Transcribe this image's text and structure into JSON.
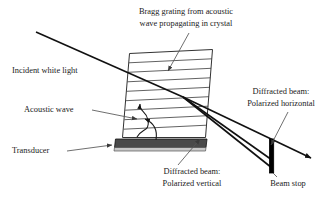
{
  "figure": {
    "background_color": "#ffffff",
    "line_color": "#1a1a1a",
    "leader_color": "#555555",
    "transducer_color": "#4a4a4a",
    "beam_stop_color": "#000000"
  },
  "labels": {
    "bragg_grating_line1": "Bragg grating from acoustic",
    "bragg_grating_line2": "wave propagating in crystal",
    "incident_white_light": "Incident white light",
    "acoustic_wave": "Acoustic wave",
    "transducer": "Transducer",
    "diffracted_horizontal_line1": "Diffracted beam:",
    "diffracted_horizontal_line2": "Polarized horizontal",
    "diffracted_vertical_line1": "Diffracted beam:",
    "diffracted_vertical_line2": "Polarized vertical",
    "beam_stop": "Beam stop"
  },
  "icons": {
    "arrow_bragg": "arrow-down-left-icon",
    "arrow_acoustic": "arrow-right-icon",
    "arrow_transducer": "arrow-right-icon",
    "arrow_diffracted_horizontal": "arrow-down-left-icon",
    "arrow_diffracted_vertical": "arrow-up-right-icon",
    "arrow_beam_tip": "arrow-right-icon",
    "acoustic_wave_curve": "wave-arrow-icon"
  },
  "components": {
    "crystal": {
      "name": "acousto-optic crystal",
      "shape": "parallelogram",
      "grating_line_count": 9
    },
    "transducer": {
      "name": "piezoelectric transducer",
      "shape": "bar"
    },
    "beam_stop": {
      "name": "beam stop",
      "shape": "vertical bar"
    }
  },
  "beams": {
    "incident": "white light entering crystal from upper left",
    "diffracted_count": 2,
    "undiffracted": "zero-order beam passing beam stop"
  }
}
